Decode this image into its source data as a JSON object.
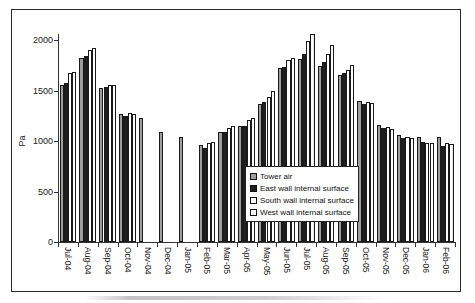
{
  "figure": {
    "ylabel": "Pa",
    "background": "#ffffff",
    "frame_border_color": "#2a2a2a"
  },
  "chart_data": {
    "type": "bar",
    "title": "",
    "xlabel": "",
    "ylabel": "Pa",
    "ylim": [
      0,
      2100
    ],
    "yticks": [
      0,
      500,
      1000,
      1500,
      2000
    ],
    "grid": false,
    "legend_position": "inside-bottom-center-right",
    "categories": [
      "Jul-04",
      "Aug-04",
      "Sep-04",
      "Oct-04",
      "Nov-04",
      "Dec-04",
      "Jan-05",
      "Feb-05",
      "Mar-05",
      "Apr-05",
      "May-05",
      "Jun-05",
      "Jul-05",
      "Aug-05",
      "Sep-05",
      "Oct-05",
      "Nov-05",
      "Dec-05",
      "Jan-06",
      "Feb-06"
    ],
    "series": [
      {
        "name": "Tower air",
        "color": "#9e9e9e",
        "pattern": "solid",
        "values": [
          1550,
          1820,
          1520,
          1270,
          1225,
          1090,
          1040,
          960,
          1090,
          1150,
          1370,
          1720,
          1810,
          1740,
          1650,
          1400,
          1160,
          1060,
          1035,
          1040
        ]
      },
      {
        "name": "East wall internal surface",
        "color": "#1f1f1f",
        "pattern": "solid",
        "values": [
          1570,
          1845,
          1530,
          1250,
          null,
          null,
          null,
          935,
          1085,
          1145,
          1390,
          1735,
          1865,
          1785,
          1670,
          1370,
          1125,
          1025,
          995,
          955
        ]
      },
      {
        "name": "South wall internal surface",
        "color": "#ffffff",
        "pattern": "solid",
        "values": [
          1670,
          1900,
          1550,
          1275,
          null,
          null,
          null,
          985,
          1130,
          1205,
          1440,
          1800,
          1990,
          1865,
          1705,
          1385,
          1140,
          1035,
          985,
          980
        ]
      },
      {
        "name": "West wall internal surface",
        "color": "#ffffff",
        "pattern": "thin-vertical-stripes",
        "values": [
          1680,
          1920,
          1555,
          1270,
          null,
          null,
          null,
          995,
          1145,
          1230,
          1495,
          1825,
          2060,
          1950,
          1750,
          1375,
          1120,
          1030,
          985,
          970
        ]
      }
    ]
  }
}
